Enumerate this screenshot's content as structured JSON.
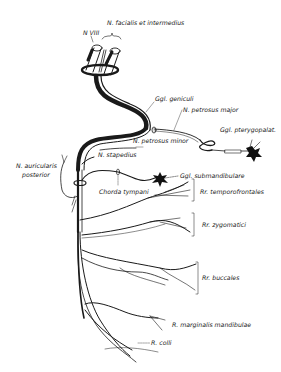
{
  "diagram": {
    "labels": {
      "n_viii": "N VIII",
      "n_facialis": "N. facialis et intermedius",
      "ggl_geniculi": "Ggl. geniculi",
      "n_petrosus_major": "N. petrosus major",
      "ggl_pterygopalat": "Ggl. pterygopalat.",
      "n_petrosus_minor": "N. petrosus minor",
      "n_stapedius": "N. stapedius",
      "n_auricularis_1": "N. auricularis",
      "n_auricularis_2": "posterior",
      "chorda_tympani": "Chorda tympani",
      "ggl_submandibulare": "Ggl. submandibulare",
      "rr_temporofrontales": "Rr. temporofrontales",
      "rr_zygomatici": "Rr. zygomatici",
      "rr_buccales": "Rr. buccales",
      "r_marginalis": "R. marginalis mandibulae",
      "r_colli": "R. colli"
    },
    "colors": {
      "ink": "#1a1a1a",
      "background": "#ffffff"
    }
  }
}
